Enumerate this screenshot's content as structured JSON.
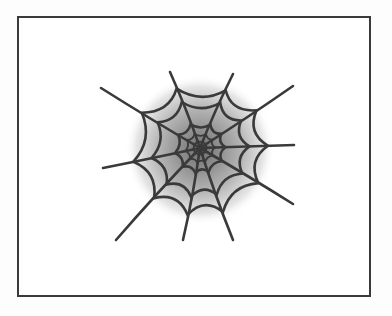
{
  "illustration": {
    "subject": "spider-web",
    "colors": {
      "frame": "#3a3a3a",
      "strand": "#3a3a3a",
      "glow_center": "#6e6e6e",
      "background": "#ffffff"
    }
  }
}
